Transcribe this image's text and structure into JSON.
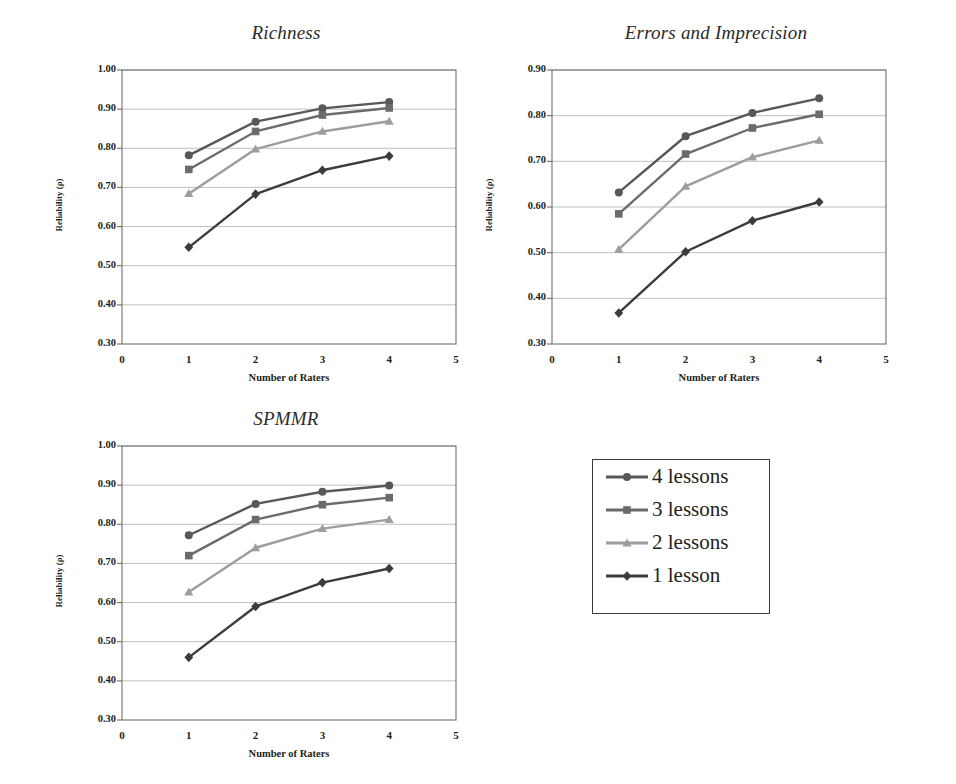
{
  "figure": {
    "caption": "",
    "axis_x_title": "Number of Raters",
    "axis_y_title": "Reliability (ρ)"
  },
  "legend": {
    "position": "bottom-right",
    "items": [
      {
        "label": "4 lessons",
        "marker": "circle",
        "color": "#585858"
      },
      {
        "label": "3 lessons",
        "marker": "square",
        "color": "#6b6b6b"
      },
      {
        "label": "2 lessons",
        "marker": "triangle",
        "color": "#9d9d9d"
      },
      {
        "label": "1 lesson",
        "marker": "diamond",
        "color": "#3c3c3c"
      }
    ]
  },
  "chart_data": [
    {
      "id": "richness",
      "type": "line",
      "title": "Richness",
      "xlabel": "Number of Raters",
      "ylabel": "Reliability (ρ)",
      "x": [
        1,
        2,
        3,
        4
      ],
      "xlim": [
        0,
        5
      ],
      "ylim": [
        0.3,
        1.0
      ],
      "xticks": [
        "0",
        "1",
        "2",
        "3",
        "4",
        "5"
      ],
      "yticks": [
        "0.30",
        "0.40",
        "0.50",
        "0.60",
        "0.70",
        "0.80",
        "0.90",
        "1.00"
      ],
      "grid": "horizontal",
      "legend_position": "external",
      "series": [
        {
          "name": "4 lessons",
          "marker": "circle",
          "color": "#585858",
          "values": [
            0.782,
            0.868,
            0.902,
            0.918
          ]
        },
        {
          "name": "3 lessons",
          "marker": "square",
          "color": "#6b6b6b",
          "values": [
            0.746,
            0.843,
            0.885,
            0.903
          ]
        },
        {
          "name": "2 lessons",
          "marker": "triangle",
          "color": "#9d9d9d",
          "values": [
            0.684,
            0.798,
            0.843,
            0.869
          ]
        },
        {
          "name": "1 lesson",
          "marker": "diamond",
          "color": "#3c3c3c",
          "values": [
            0.547,
            0.683,
            0.744,
            0.78
          ]
        }
      ]
    },
    {
      "id": "errors-and-imprecision",
      "type": "line",
      "title": "Errors and Imprecision",
      "xlabel": "Number of Raters",
      "ylabel": "Reliability (ρ)",
      "x": [
        1,
        2,
        3,
        4
      ],
      "xlim": [
        0,
        5
      ],
      "ylim": [
        0.3,
        0.9
      ],
      "xticks": [
        "0",
        "1",
        "2",
        "3",
        "4",
        "5"
      ],
      "yticks": [
        "0.30",
        "0.40",
        "0.50",
        "0.60",
        "0.70",
        "0.80",
        "0.90"
      ],
      "grid": "horizontal",
      "legend_position": "external",
      "series": [
        {
          "name": "4 lessons",
          "marker": "circle",
          "color": "#585858",
          "values": [
            0.632,
            0.755,
            0.806,
            0.838
          ]
        },
        {
          "name": "3 lessons",
          "marker": "square",
          "color": "#6b6b6b",
          "values": [
            0.585,
            0.716,
            0.773,
            0.803
          ]
        },
        {
          "name": "2 lessons",
          "marker": "triangle",
          "color": "#9d9d9d",
          "values": [
            0.507,
            0.645,
            0.709,
            0.746
          ]
        },
        {
          "name": "1 lesson",
          "marker": "diamond",
          "color": "#3c3c3c",
          "values": [
            0.368,
            0.502,
            0.57,
            0.611
          ]
        }
      ]
    },
    {
      "id": "spmmr",
      "type": "line",
      "title": "SPMMR",
      "xlabel": "Number of Raters",
      "ylabel": "Reliability (ρ)",
      "x": [
        1,
        2,
        3,
        4
      ],
      "xlim": [
        0,
        5
      ],
      "ylim": [
        0.3,
        1.0
      ],
      "xticks": [
        "0",
        "1",
        "2",
        "3",
        "4",
        "5"
      ],
      "yticks": [
        "0.30",
        "0.40",
        "0.50",
        "0.60",
        "0.70",
        "0.80",
        "0.90",
        "1.00"
      ],
      "grid": "horizontal",
      "legend_position": "external",
      "series": [
        {
          "name": "4 lessons",
          "marker": "circle",
          "color": "#585858",
          "values": [
            0.772,
            0.852,
            0.883,
            0.899
          ]
        },
        {
          "name": "3 lessons",
          "marker": "square",
          "color": "#6b6b6b",
          "values": [
            0.72,
            0.812,
            0.85,
            0.868
          ]
        },
        {
          "name": "2 lessons",
          "marker": "triangle",
          "color": "#9d9d9d",
          "values": [
            0.627,
            0.74,
            0.789,
            0.812
          ]
        },
        {
          "name": "1 lesson",
          "marker": "diamond",
          "color": "#3c3c3c",
          "values": [
            0.46,
            0.59,
            0.651,
            0.687
          ]
        }
      ]
    }
  ]
}
